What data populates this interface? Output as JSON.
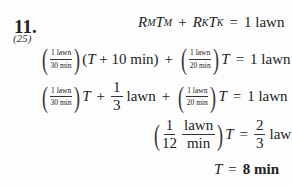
{
  "problem": {
    "number": "11.",
    "reference": "(25)"
  },
  "lines": [
    {
      "id": "line1",
      "text": "R_M T_M + R_K T_K = 1 lawn",
      "R_M": "R",
      "M": "M",
      "T_M": "T",
      "R_K": "R",
      "K": "K",
      "T_K": "T",
      "plus": "+",
      "eq": "=",
      "rhs": "1 lawn"
    },
    {
      "id": "line2",
      "text": "(1 lawn / 30 min)(T + 10 min) + (1 lawn / 20 min)T = 1 lawn",
      "frac1_num": "1 lawn",
      "frac1_den": "30 min",
      "group": "(T + 10 min)",
      "plus": "+",
      "frac2_num": "1 lawn",
      "frac2_den": "20 min",
      "T": "T",
      "eq": "=",
      "rhs": "1 lawn"
    },
    {
      "id": "line3",
      "text": "(1 lawn / 30 min)T + 1/3 lawn + (1 lawn / 20 min)T = 1 lawn",
      "frac1_num": "1 lawn",
      "frac1_den": "30 min",
      "T": "T",
      "plus": "+",
      "third_num": "1",
      "third_den": "3",
      "lawn": "lawn",
      "frac2_num": "1 lawn",
      "frac2_den": "20 min",
      "eq": "=",
      "rhs": "1 lawn"
    },
    {
      "id": "line4",
      "text": "(1/12 lawn/min)T = 2/3 lawn",
      "a_num": "1",
      "a_den": "12",
      "u_num": "lawn",
      "u_den": "min",
      "T": "T",
      "eq": "=",
      "r_num": "2",
      "r_den": "3",
      "lawn": "lawn"
    },
    {
      "id": "line5",
      "text": "T = 8 min",
      "T": "T",
      "eq": "=",
      "answer": "8 min"
    }
  ]
}
